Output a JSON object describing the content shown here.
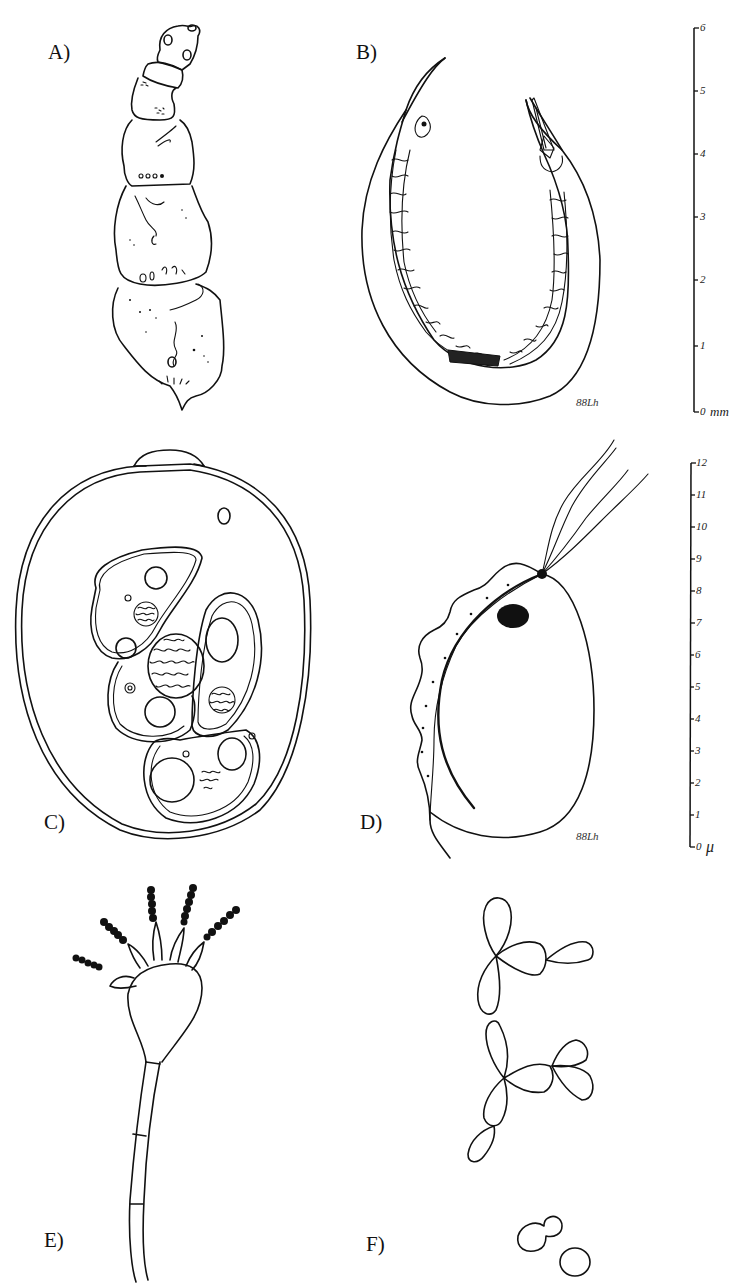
{
  "figure": {
    "panels": [
      {
        "id": "A",
        "label": "A)",
        "subject": "segmented-larva-drawing"
      },
      {
        "id": "B",
        "label": "B)",
        "subject": "nematode-drawing",
        "signature": "88Lh"
      },
      {
        "id": "C",
        "label": "C)",
        "subject": "cyst-with-trophozoites-drawing"
      },
      {
        "id": "D",
        "label": "D)",
        "subject": "flagellate-drawing",
        "signature": "88Lh"
      },
      {
        "id": "E",
        "label": "E)",
        "subject": "conidiophore-drawing"
      },
      {
        "id": "F",
        "label": "F)",
        "subject": "budding-yeast-cells-drawing"
      }
    ],
    "scale_bars": [
      {
        "name": "mm-scale",
        "unit": "mm",
        "ticks": [
          "0",
          "1",
          "2",
          "3",
          "4",
          "5",
          "6"
        ],
        "applies_to": [
          "A",
          "B"
        ]
      },
      {
        "name": "micron-scale",
        "unit": "μ",
        "ticks": [
          "0",
          "1",
          "2",
          "3",
          "4",
          "5",
          "6",
          "7",
          "8",
          "9",
          "10",
          "11",
          "12"
        ],
        "applies_to": [
          "C",
          "D"
        ]
      }
    ]
  }
}
